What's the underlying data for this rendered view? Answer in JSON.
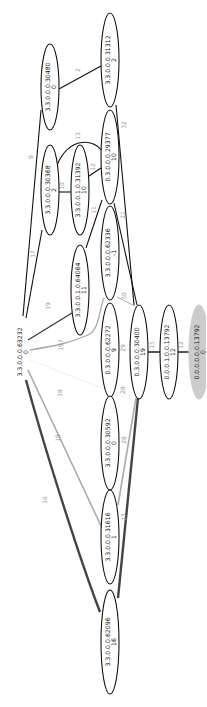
{
  "diagram": {
    "type": "graph",
    "nodes": [
      {
        "id": "n31312",
        "line1": "3.3.0.0.0.31312",
        "line2": "2",
        "cx": 110,
        "cy": 60,
        "rx": 9,
        "ry": 47,
        "fill": "#ffffff",
        "stroke": "#111111"
      },
      {
        "id": "n30480",
        "line1": "3.3.0.0.0.30480",
        "line2": "0",
        "cx": 50,
        "cy": 87,
        "rx": 9,
        "ry": 43,
        "fill": "#ffffff",
        "stroke": "#111111"
      },
      {
        "id": "n29377",
        "line1": "0.3.0.0.0.29377",
        "line2": "10",
        "cx": 110,
        "cy": 157,
        "rx": 9,
        "ry": 47,
        "fill": "#ffffff",
        "stroke": "#111111"
      },
      {
        "id": "n30368",
        "line1": "3.3.0.0.0.30368",
        "line2": "2",
        "cx": 50,
        "cy": 190,
        "rx": 9,
        "ry": 45,
        "fill": "#ffffff",
        "stroke": "#111111"
      },
      {
        "id": "n31392",
        "line1": "3.3.0.0.1.0.31392",
        "line2": "10",
        "cx": 80,
        "cy": 190,
        "rx": 9,
        "ry": 45,
        "fill": "#ffffff",
        "stroke": "#111111"
      },
      {
        "id": "n62336",
        "line1": "3.3.0.0.0.62336",
        "line2": "-1",
        "cx": 110,
        "cy": 253,
        "rx": 9,
        "ry": 47,
        "fill": "#ffffff",
        "stroke": "#111111"
      },
      {
        "id": "n64064",
        "line1": "3.3.0.0.1.0.64064",
        "line2": "11",
        "cx": 80,
        "cy": 290,
        "rx": 9,
        "ry": 45,
        "fill": "#ffffff",
        "stroke": "#111111"
      },
      {
        "id": "n63232",
        "line1": "3.3.0.0.0.63232",
        "line2": "0",
        "cx": 22,
        "cy": 352,
        "rx": 0,
        "ry": 0,
        "fill": "none",
        "stroke": "none"
      },
      {
        "id": "n62272",
        "line1": "0.3.0.0.0.62272",
        "line2": "9",
        "cx": 110,
        "cy": 350,
        "rx": 9,
        "ry": 47,
        "fill": "#ffffff",
        "stroke": "#111111"
      },
      {
        "id": "n30400",
        "line1": "0.3.0.0.0.30400",
        "line2": "19",
        "cx": 139,
        "cy": 352,
        "rx": 9,
        "ry": 47,
        "fill": "#ffffff",
        "stroke": "#111111"
      },
      {
        "id": "n13792a",
        "line1": "0.0.0.1.0.0.13792",
        "line2": "12",
        "cx": 169,
        "cy": 352,
        "rx": 9,
        "ry": 47,
        "fill": "#ffffff",
        "stroke": "#111111"
      },
      {
        "id": "n13792b",
        "line1": "0.0.0.0.0.0.13792",
        "line2": "0",
        "cx": 199,
        "cy": 352,
        "rx": 10,
        "ry": 47,
        "fill": "#cccccc",
        "stroke": "#cccccc"
      },
      {
        "id": "n30592",
        "line1": "3.3.0.0.0.30592",
        "line2": "0",
        "cx": 110,
        "cy": 443,
        "rx": 9,
        "ry": 47,
        "fill": "#ffffff",
        "stroke": "#111111"
      },
      {
        "id": "n31616",
        "line1": "3.3.0.0.0.31616",
        "line2": "1",
        "cx": 110,
        "cy": 537,
        "rx": 9,
        "ry": 47,
        "fill": "#ffffff",
        "stroke": "#111111"
      },
      {
        "id": "n62096",
        "line1": "3.3.0.0.0.62096",
        "line2": "16",
        "cx": 110,
        "cy": 642,
        "rx": 9,
        "ry": 52,
        "fill": "#ffffff",
        "stroke": "#111111"
      }
    ],
    "edges": [
      {
        "label": "2",
        "path": "M59,89 L101,66",
        "lx": 80,
        "ly": 70,
        "color": "#111111",
        "width": 1.1
      },
      {
        "label": "9",
        "path": "M41,110 L23,316",
        "lx": 33,
        "ly": 157,
        "color": "#111111",
        "width": 1.1
      },
      {
        "label": "17",
        "path": "M42,230 L26,318",
        "lx": 35,
        "ly": 254,
        "color": "#111111",
        "width": 1.1
      },
      {
        "label": "13",
        "path": "M57,165 C70,135 95,140 101,150",
        "lx": 80,
        "ly": 136,
        "color": "#111111",
        "width": 1.1
      },
      {
        "label": "10",
        "path": "M59,192 L71,192",
        "lx": 64,
        "ly": 186,
        "color": "#111111",
        "width": 1.1
      },
      {
        "label": "12",
        "path": "M89,176 L101,168",
        "lx": 95,
        "ly": 167,
        "color": "#111111",
        "width": 1.1
      },
      {
        "label": "32",
        "path": "M116,105 L134,305",
        "lx": 126,
        "ly": 125,
        "color": "#111111",
        "width": 1.1
      },
      {
        "label": "11",
        "path": "M102,200 L86,248",
        "lx": 96,
        "ly": 210,
        "color": "#111111",
        "width": 1.1
      },
      {
        "label": "21",
        "path": "M114,203 L137,305",
        "lx": 125,
        "ly": 215,
        "color": "#111111",
        "width": 1.1
      },
      {
        "label": "19",
        "path": "M28,340 L72,313",
        "lx": 50,
        "ly": 306,
        "color": "#333333",
        "width": 1.2
      },
      {
        "label": "197",
        "path": "M30,350 C55,346 70,343 88,335 C100,330 100,305 104,298",
        "lx": 63,
        "ly": 345,
        "color": "#aaaaaa",
        "width": 1.3
      },
      {
        "label": "30",
        "path": "M117,297 L135,306",
        "lx": 126,
        "ly": 296,
        "color": "#aaaaaa",
        "width": 1.0
      },
      {
        "label": "18",
        "path": "M30,360 L132,400",
        "lx": 62,
        "ly": 393,
        "color": "#eeeeee",
        "width": 1.0
      },
      {
        "label": "29",
        "path": "M118,350 L130,350",
        "lx": 125,
        "ly": 348,
        "color": "#eeeeee",
        "width": 1.0
      },
      {
        "label": "28",
        "path": "M118,392 L132,396",
        "lx": 125,
        "ly": 390,
        "color": "#eeeeee",
        "width": 1.0
      },
      {
        "label": "19",
        "path": "M28,370 L102,528",
        "lx": 60,
        "ly": 438,
        "color": "#aaaaaa",
        "width": 1.6
      },
      {
        "label": "28",
        "path": "M118,505 L136,398",
        "lx": 126,
        "ly": 440,
        "color": "#aaaaaa",
        "width": 1.6
      },
      {
        "label": "16",
        "path": "M26,380 C45,450 80,560 100,612",
        "lx": 47,
        "ly": 500,
        "color": "#444444",
        "width": 2.4
      },
      {
        "label": "27",
        "path": "M118,598 L138,398",
        "lx": 126,
        "ly": 517,
        "color": "#444444",
        "width": 2.4
      },
      {
        "label": "15",
        "path": "M148,352 L160,352",
        "lx": 154,
        "ly": 345,
        "color": "#555555",
        "width": 2.0
      },
      {
        "label": "12",
        "path": "M178,352 L189,352",
        "lx": 183,
        "ly": 345,
        "color": "#555555",
        "width": 2.0
      }
    ]
  }
}
